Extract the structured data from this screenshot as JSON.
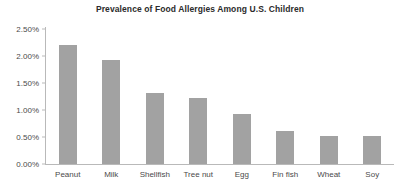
{
  "chart_data": {
    "type": "bar",
    "title": "Prevalence of Food Allergies Among U.S. Children",
    "xlabel": "",
    "ylabel": "",
    "categories": [
      "Peanut",
      "Milk",
      "Shellfish",
      "Tree nut",
      "Egg",
      "Fin fish",
      "Wheat",
      "Soy"
    ],
    "values": [
      2.2,
      1.92,
      1.32,
      1.22,
      0.93,
      0.61,
      0.52,
      0.52
    ],
    "value_format": "percent",
    "ylim": [
      0.0,
      2.5
    ],
    "ytick_values": [
      0.0,
      0.5,
      1.0,
      1.5,
      2.0,
      2.5
    ],
    "ytick_labels": [
      "0.00%",
      "0.50%",
      "1.00%",
      "1.50%",
      "2.00%",
      "2.50%"
    ],
    "grid": false,
    "legend": false,
    "bar_color": "#a2a2a2",
    "axis_color": "#b9b9b9",
    "text_color": "#4a4a4a",
    "title_color": "#2b2b2b"
  }
}
